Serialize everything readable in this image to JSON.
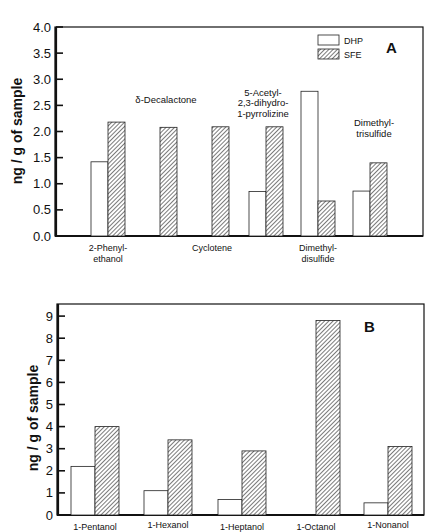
{
  "legend": {
    "items": [
      {
        "label": "DHP",
        "style": "open"
      },
      {
        "label": "SFE",
        "style": "hatched"
      }
    ]
  },
  "chart_data": [
    {
      "type": "bar",
      "panel": "A",
      "title": "",
      "xlabel": "",
      "ylabel": "ng / g of sample",
      "ylim": [
        0,
        4.0
      ],
      "yticks": [
        "0.0",
        "0.5",
        "1.0",
        "1.5",
        "2.0",
        "2.5",
        "3.0",
        "3.5",
        "4.0"
      ],
      "grid": false,
      "legend_position": "top-right",
      "categories": [
        "2-Phenylethanol",
        "δ-Decalactone",
        "Cyclotene",
        "5-Acetyl-2,3-dihydro-1-pyrrolizine",
        "Dimethyldisulfide",
        "Dimethyltrisulfide"
      ],
      "category_labels_below": [
        {
          "index": 0,
          "lines": [
            "2-Phenyl-",
            "ethanol"
          ]
        },
        {
          "index": 2,
          "lines": [
            "Cyclotene"
          ]
        },
        {
          "index": 4,
          "lines": [
            "Dimethyl-",
            "disulfide"
          ]
        }
      ],
      "category_labels_inside": [
        {
          "index": 1,
          "lines": [
            "δ-Decalactone"
          ]
        },
        {
          "index": 3,
          "lines": [
            "5-Acetyl-",
            "2,3-dihydro-",
            "1-pyrrolizine"
          ]
        },
        {
          "index": 5,
          "lines": [
            "Dimethyl-",
            "trisulfide"
          ]
        }
      ],
      "series": [
        {
          "name": "DHP",
          "values": [
            1.42,
            null,
            null,
            0.85,
            2.77,
            0.86
          ]
        },
        {
          "name": "SFE",
          "values": [
            2.18,
            2.08,
            2.09,
            2.09,
            0.67,
            1.4
          ]
        }
      ]
    },
    {
      "type": "bar",
      "panel": "B",
      "title": "",
      "xlabel": "",
      "ylabel": "ng / g of sample",
      "ylim": [
        0,
        9.5
      ],
      "yticks": [
        "0",
        "1",
        "2",
        "3",
        "4",
        "5",
        "6",
        "7",
        "8",
        "9"
      ],
      "grid": false,
      "categories": [
        "1-Pentanol",
        "1-Hexanol",
        "1-Heptanol",
        "1-Octanol",
        "1-Nonanol"
      ],
      "series": [
        {
          "name": "DHP",
          "values": [
            2.2,
            1.1,
            0.7,
            null,
            0.55
          ]
        },
        {
          "name": "SFE",
          "values": [
            4.0,
            3.4,
            2.9,
            8.8,
            3.1
          ]
        }
      ]
    }
  ]
}
